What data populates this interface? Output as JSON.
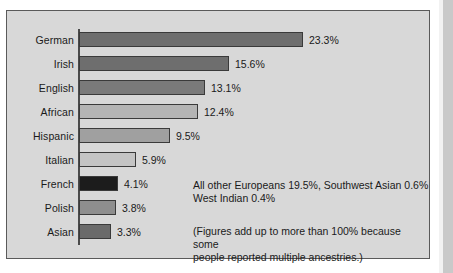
{
  "chart_data": {
    "type": "bar",
    "orientation": "horizontal",
    "title": "",
    "subtitle": "",
    "xlabel": "",
    "ylabel": "",
    "grid": false,
    "legend": "none",
    "value_suffix": "%",
    "xlim": [
      0,
      25
    ],
    "categories": [
      "German",
      "Irish",
      "English",
      "African",
      "Hispanic",
      "Italian",
      "French",
      "Polish",
      "Asian"
    ],
    "values": [
      23.3,
      15.6,
      13.1,
      12.4,
      9.5,
      5.9,
      4.1,
      3.8,
      3.3
    ],
    "value_labels": [
      "23.3%",
      "15.6%",
      "13.1%",
      "12.4%",
      "9.5%",
      "5.9%",
      "4.1%",
      "3.8%",
      "3.3%"
    ],
    "bar_colors": [
      "#6e6e6e",
      "#6e6e6e",
      "#7a7a7a",
      "#b4b4b4",
      "#a0a0a0",
      "#c4c4c4",
      "#1c1c1c",
      "#8e8e8e",
      "#6a6a6a"
    ],
    "annotations": [
      "All other Europeans 19.5%, Southwest Asian 0.6%\nWest Indian 0.4%",
      "(Figures add up to more than 100% because some\npeople reported multiple ancestries.)"
    ]
  },
  "style": {
    "panel_background": "#d8d8d8",
    "panel_border": "#5a5a5a",
    "page_background": "#ffffff",
    "text_color": "#1a1a1a",
    "axis_color": "#4a4a4a"
  }
}
